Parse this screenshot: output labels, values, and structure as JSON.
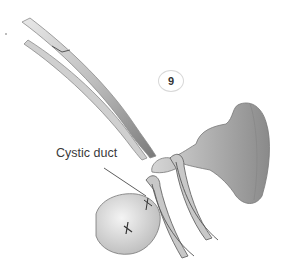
{
  "figure": {
    "step_number": "9",
    "label": "Cystic duct",
    "colors": {
      "background": "#ffffff",
      "ink": "#3a3a3a",
      "tissue_shade": "#9a9a9a",
      "instrument_shade": "#7a7a7a"
    }
  }
}
